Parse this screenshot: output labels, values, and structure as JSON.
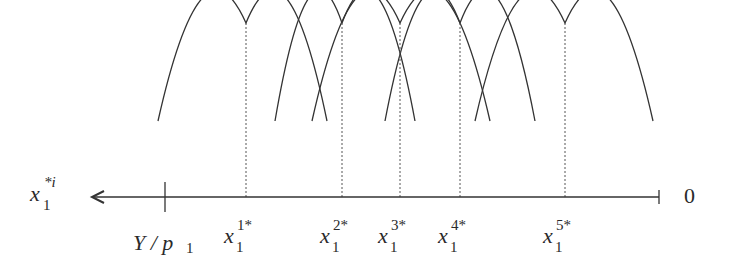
{
  "diagram": {
    "type": "overlapping-concave-curves-on-reversed-axis",
    "colors": {
      "curve": "#333333",
      "axis": "#333333",
      "dotted": "#555555",
      "text": "#2a2a2a",
      "background": "#ffffff"
    },
    "axis": {
      "y": 197,
      "x_start": 92,
      "x_end": 659,
      "direction": "leftward-arrow",
      "label_left": {
        "base": "x",
        "sub": "1",
        "sup": "*i"
      },
      "label_right": "0",
      "tick_Y_over_p1": {
        "x": 165,
        "label": "Y / p",
        "label_sub": "1"
      }
    },
    "curves": [
      {
        "id": 1,
        "peak_x": 246,
        "left_x": 158,
        "right_x": 327,
        "label": {
          "base": "x",
          "sub": "1",
          "sup": "1*"
        }
      },
      {
        "id": 2,
        "peak_x": 342,
        "left_x": 275,
        "right_x": 415,
        "label": {
          "base": "x",
          "sub": "1",
          "sup": "2*"
        }
      },
      {
        "id": 3,
        "peak_x": 400,
        "left_x": 312,
        "right_x": 490,
        "label": {
          "base": "x",
          "sub": "1",
          "sup": "3*"
        }
      },
      {
        "id": 4,
        "peak_x": 460,
        "left_x": 385,
        "right_x": 535,
        "label": {
          "base": "x",
          "sub": "1",
          "sup": "4*"
        }
      },
      {
        "id": 5,
        "peak_x": 565,
        "left_x": 475,
        "right_x": 653,
        "label": {
          "base": "x",
          "sub": "1",
          "sup": "5*"
        }
      }
    ],
    "peak_y": 23,
    "end_y": 121
  }
}
